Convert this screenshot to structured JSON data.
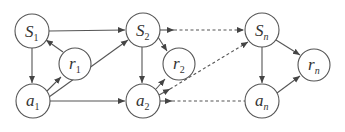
{
  "diagram": {
    "type": "graphical-model",
    "nodes": [
      {
        "id": "S1",
        "base": "S",
        "sub": "1",
        "x": 32,
        "y": 31
      },
      {
        "id": "r1",
        "base": "r",
        "sub": "1",
        "x": 75,
        "y": 64
      },
      {
        "id": "a1",
        "base": "a",
        "sub": "1",
        "x": 33,
        "y": 101
      },
      {
        "id": "S2",
        "base": "S",
        "sub": "2",
        "x": 143,
        "y": 30
      },
      {
        "id": "r2",
        "base": "r",
        "sub": "2",
        "x": 179,
        "y": 64
      },
      {
        "id": "a2",
        "base": "a",
        "sub": "2",
        "x": 143,
        "y": 101
      },
      {
        "id": "Sn",
        "base": "S",
        "sub": "n",
        "x": 262,
        "y": 30
      },
      {
        "id": "rn",
        "base": "r",
        "sub": "n",
        "x": 314,
        "y": 65
      },
      {
        "id": "an",
        "base": "a",
        "sub": "n",
        "x": 262,
        "y": 101
      }
    ],
    "edges": [
      {
        "from": "S1",
        "to": "S2",
        "style": "solid"
      },
      {
        "from": "S1",
        "to": "a1",
        "style": "solid"
      },
      {
        "from": "r1",
        "to": "S1",
        "style": "solid"
      },
      {
        "from": "a1",
        "to": "r1",
        "style": "solid"
      },
      {
        "from": "a1",
        "to": "S2",
        "style": "solid"
      },
      {
        "from": "a1",
        "to": "a2",
        "style": "solid"
      },
      {
        "from": "S2",
        "to": "a2",
        "style": "solid"
      },
      {
        "from": "S2",
        "to": "r2",
        "style": "solid"
      },
      {
        "from": "a2",
        "to": "r2",
        "style": "solid"
      },
      {
        "from": "S2",
        "to": "Sn",
        "style": "dashed"
      },
      {
        "from": "a2",
        "to": "Sn",
        "style": "dashed"
      },
      {
        "from": "a2",
        "to": "an",
        "style": "dashed"
      },
      {
        "from": "Sn",
        "to": "an",
        "style": "solid"
      },
      {
        "from": "Sn",
        "to": "rn",
        "style": "solid"
      },
      {
        "from": "an",
        "to": "rn",
        "style": "solid"
      }
    ],
    "colors": {
      "stroke": "#555555",
      "text": "#333333",
      "background": "#ffffff"
    }
  },
  "labels": {
    "S1": {
      "base": "S",
      "sub": "1"
    },
    "r1": {
      "base": "r",
      "sub": "1"
    },
    "a1": {
      "base": "a",
      "sub": "1"
    },
    "S2": {
      "base": "S",
      "sub": "2"
    },
    "r2": {
      "base": "r",
      "sub": "2"
    },
    "a2": {
      "base": "a",
      "sub": "2"
    },
    "Sn": {
      "base": "S",
      "sub": "n"
    },
    "rn": {
      "base": "r",
      "sub": "n"
    },
    "an": {
      "base": "a",
      "sub": "n"
    }
  }
}
